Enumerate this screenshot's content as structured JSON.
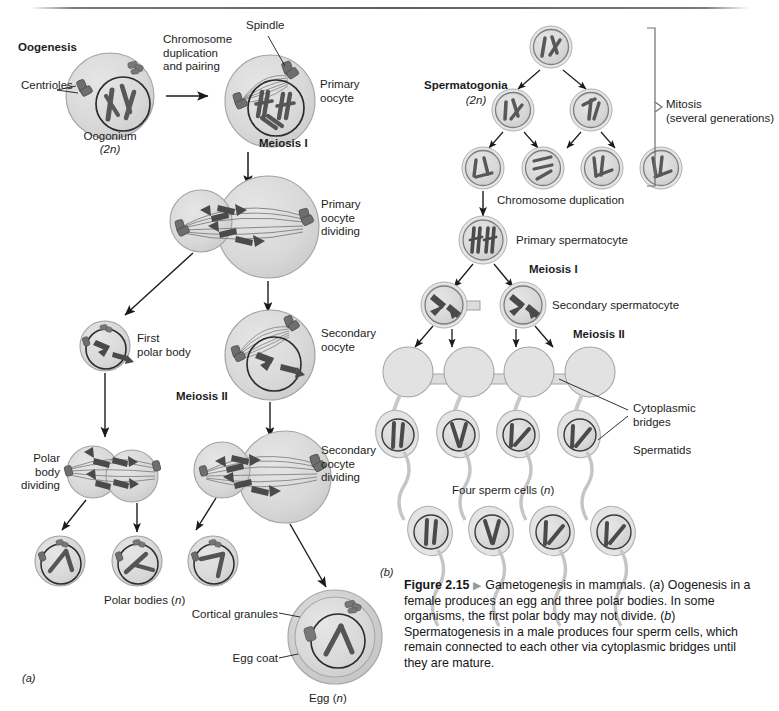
{
  "figure": {
    "number": "Figure 2.15",
    "marker": "▶",
    "caption_text": "Gametogenesis in mammals. (a) Oogenesis in a female produces an egg and three polar bodies. In some organisms, the first polar body may not divide. (b) Spermatogenesis in a male produces four sperm cells, which remain connected to each other via cytoplasmic bridges until they are mature.",
    "panel_a_label": "(a)",
    "panel_b_label": "(b)"
  },
  "oogenesis": {
    "heading": "Oogenesis",
    "labels": {
      "centrioles": "Centrioles",
      "oogonium": "Oogonium",
      "oogonium_ploidy": "(2n)",
      "chromosome_duplication": "Chromosome\nduplication\nand pairing",
      "spindle": "Spindle",
      "primary_oocyte": "Primary\noocyte",
      "meiosis_i": "Meiosis I",
      "primary_oocyte_dividing": "Primary\noocyte\ndividing",
      "first_polar_body": "First\npolar body",
      "secondary_oocyte": "Secondary\noocyte",
      "meiosis_ii": "Meiosis II",
      "polar_body_dividing": "Polar\nbody\ndividing",
      "secondary_oocyte_dividing": "Secondary\noocyte\ndividing",
      "polar_bodies": "Polar bodies (n)",
      "cortical_granules": "Cortical granules",
      "egg_coat": "Egg coat",
      "egg": "Egg (n)"
    }
  },
  "spermatogenesis": {
    "labels": {
      "spermatogonia": "Spermatogonia",
      "spermatogonia_ploidy": "(2n)",
      "mitosis": "Mitosis\n(several generations)",
      "chromosome_duplication": "Chromosome duplication",
      "primary_spermatocyte": "Primary spermatocyte",
      "meiosis_i": "Meiosis I",
      "secondary_spermatocyte": "Secondary spermatocyte",
      "meiosis_ii": "Meiosis II",
      "cytoplasmic_bridges": "Cytoplasmic\nbridges",
      "spermatids": "Spermatids",
      "four_sperm_cells": "Four sperm cells (n)"
    }
  },
  "colors": {
    "cell_fill": "#d9d9d9",
    "cell_stroke": "#9a9a9a",
    "cell_halo": "#e8e8e8",
    "nucleus_stroke": "#2a2a2a",
    "chromosome": "#585858",
    "chromosome_dark": "#3b3b3b",
    "centriole": "#6e6e6e",
    "spindle": "#8a8a8a",
    "arrow": "#1a1a1a",
    "text": "#1d1d1d",
    "rule": "#5f5f5f",
    "egg_coat": "#cfcfcf"
  }
}
